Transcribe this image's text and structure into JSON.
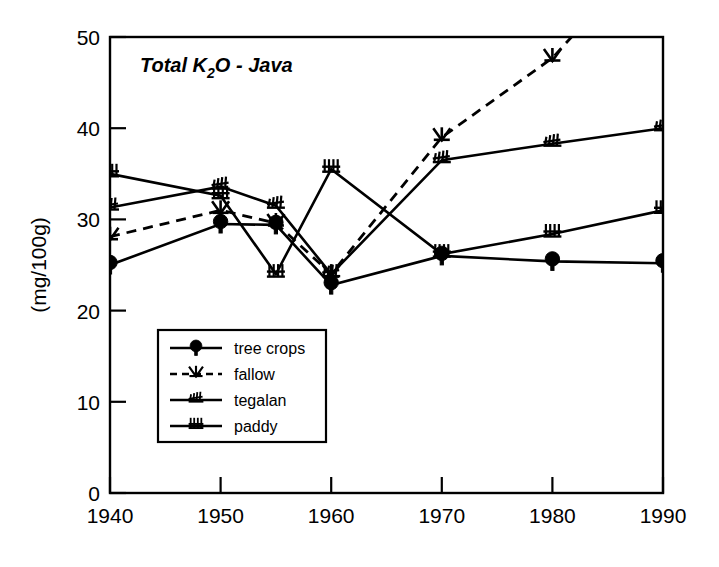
{
  "chart_data": {
    "type": "line",
    "title": "Total K2O - Java",
    "title_display": "Total K",
    "title_sub": "2",
    "title_tail": "O - Java",
    "xlabel": "",
    "ylabel": "(mg/100g)",
    "x": [
      1940,
      1950,
      1955,
      1960,
      1970,
      1980,
      1990
    ],
    "xlim": [
      1940,
      1990
    ],
    "ylim": [
      0,
      50
    ],
    "xticks": [
      "1940",
      "1950",
      "1960",
      "1970",
      "1980",
      "1990"
    ],
    "xtick_values": [
      1940,
      1950,
      1960,
      1970,
      1980,
      1990
    ],
    "yticks": [
      "0",
      "10",
      "20",
      "30",
      "40",
      "50"
    ],
    "ytick_values": [
      0,
      10,
      20,
      30,
      40,
      50
    ],
    "grid": false,
    "legend_position": "lower-left-inside",
    "series": [
      {
        "name": "tree crops",
        "marker": "tree-crops-glyph",
        "linestyle": "solid",
        "x": [
          1940,
          1950,
          1955,
          1960,
          1970,
          1980,
          1990
        ],
        "values": [
          25.0,
          29.5,
          29.4,
          22.8,
          26.0,
          25.4,
          25.2
        ]
      },
      {
        "name": "fallow",
        "marker": "fallow-glyph",
        "linestyle": "dashed",
        "x": [
          1940,
          1950,
          1955,
          1960,
          1970,
          1980,
          1990
        ],
        "values": [
          28.1,
          31.0,
          29.6,
          24.0,
          39.0,
          47.7,
          61.0
        ],
        "note": "line exits top of plot between 1980 and 1990"
      },
      {
        "name": "tegalan",
        "marker": "tegalan-glyph",
        "linestyle": "solid",
        "x": [
          1940,
          1950,
          1955,
          1960,
          1970,
          1980,
          1990
        ],
        "values": [
          31.3,
          33.6,
          31.5,
          24.0,
          36.5,
          38.3,
          40.0
        ]
      },
      {
        "name": "paddy",
        "marker": "paddy-glyph",
        "linestyle": "solid",
        "x": [
          1940,
          1950,
          1955,
          1960,
          1970,
          1980,
          1990
        ],
        "values": [
          35.0,
          32.6,
          24.0,
          35.5,
          26.2,
          28.4,
          31.0
        ]
      }
    ]
  },
  "legend": {
    "items": [
      {
        "label": "tree crops"
      },
      {
        "label": "fallow"
      },
      {
        "label": "tegalan"
      },
      {
        "label": "paddy"
      }
    ]
  }
}
